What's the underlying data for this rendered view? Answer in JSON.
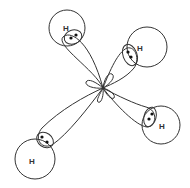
{
  "diagram": {
    "type": "sp3-hybrid-orbitals-methane",
    "center": {
      "x": 103,
      "y": 88
    },
    "atoms": [
      {
        "label": "H",
        "cx": 67,
        "cy": 28,
        "r": 18,
        "label_x": 65,
        "label_y": 31
      },
      {
        "label": "H",
        "cx": 147,
        "cy": 47,
        "r": 20,
        "label_x": 139,
        "label_y": 51
      },
      {
        "label": "H",
        "cx": 35,
        "cy": 159,
        "r": 20,
        "label_x": 30,
        "label_y": 163
      },
      {
        "label": "H",
        "cx": 161,
        "cy": 125,
        "r": 19,
        "label_x": 160,
        "label_y": 128
      }
    ],
    "electron_pairs": [
      {
        "dots": [
          [
            71,
            37
          ],
          [
            76,
            35
          ]
        ]
      },
      {
        "dots": [
          [
            128,
            52
          ],
          [
            131,
            56
          ]
        ]
      },
      {
        "dots": [
          [
            42,
            137
          ],
          [
            46,
            142
          ]
        ]
      },
      {
        "dots": [
          [
            151,
            114
          ],
          [
            149,
            119
          ]
        ]
      }
    ]
  }
}
